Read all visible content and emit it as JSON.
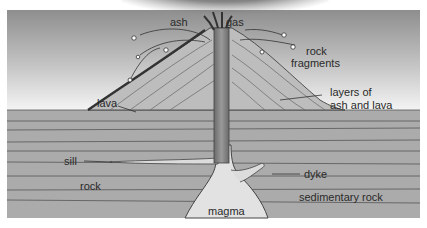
{
  "diagram": {
    "labels": {
      "ash": "ash",
      "gas": "gas",
      "rock_fragments_1": "rock",
      "rock_fragments_2": "fragments",
      "lava": "lava",
      "layers_1": "layers of",
      "layers_2": "ash and lava",
      "sill": "sill",
      "rock": "rock",
      "dyke": "dyke",
      "sedimentary_rock": "sedimentary rock",
      "magma": "magma"
    },
    "colors": {
      "sky_top": "#9a9a9a",
      "sky_bottom": "#ffffff",
      "cloud": "#3a3a3a",
      "cone": "#b8b8b8",
      "strata": "#a9a9a9",
      "magma": "#dedede",
      "vent": "#7a7a7a",
      "lava_flow": "#444444",
      "line": "#4a4a4a"
    }
  }
}
